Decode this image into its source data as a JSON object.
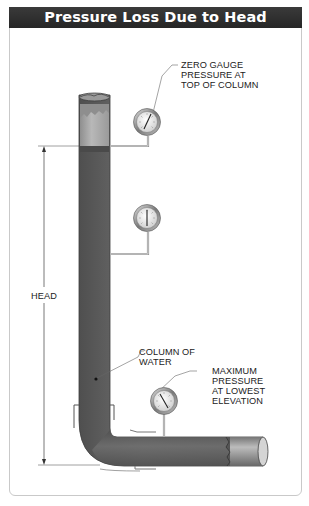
{
  "title": "Pressure Loss Due to Head",
  "labels": {
    "zero_gauge": [
      "ZERO GAUGE",
      "PRESSURE AT",
      "TOP OF COLUMN"
    ],
    "head": "HEAD",
    "column_of_water": [
      "COLUMN OF",
      "WATER"
    ],
    "max_pressure": [
      "MAXIMUM",
      "PRESSURE",
      "AT LOWEST",
      "ELEVATION"
    ]
  },
  "gauges": [
    {
      "name": "top-gauge",
      "position": "top of column"
    },
    {
      "name": "middle-gauge",
      "position": "mid column"
    },
    {
      "name": "bottom-gauge",
      "position": "lowest elevation"
    }
  ],
  "colors": {
    "title_bar": "#2e2e2e",
    "pipe": "#6e6e6e",
    "water": "#5a5a5a",
    "air": "#a8a8a8",
    "frame": "#c9c9c9"
  }
}
